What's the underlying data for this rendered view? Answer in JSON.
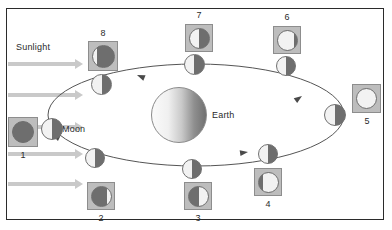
{
  "diagram": {
    "sunlight_label": "Sunlight",
    "earth_label": "Earth",
    "moon_label": "Moon",
    "orbit_direction": "counterclockwise",
    "colors": {
      "lit": "#f2f2f2",
      "dark": "#6e6e6e",
      "box_fill": "#bdbdbd",
      "box_border": "#8d8d8d",
      "arrow": "#c9c9c9",
      "orbit_line": "#555555",
      "frame_border": "#2b2b2b",
      "text": "#2a2a2a"
    },
    "sunlight_arrows": [
      {
        "x": 8,
        "y": 62,
        "length": 68
      },
      {
        "x": 8,
        "y": 93,
        "length": 68
      },
      {
        "x": 8,
        "y": 125,
        "length": 68
      },
      {
        "x": 8,
        "y": 152,
        "length": 68
      },
      {
        "x": 8,
        "y": 182,
        "length": 68
      }
    ],
    "earth": {
      "x": 151,
      "y": 87,
      "size": 56
    },
    "orbit": {
      "cx": 196,
      "cy": 115,
      "rx": 148,
      "ry": 51
    },
    "orbit_moons": [
      {
        "id": 1,
        "x": 41,
        "y": 118,
        "size": 22
      },
      {
        "id": 2,
        "x": 85,
        "y": 148,
        "size": 20
      },
      {
        "id": 3,
        "x": 182,
        "y": 159,
        "size": 20
      },
      {
        "id": 4,
        "x": 258,
        "y": 144,
        "size": 20
      },
      {
        "id": 5,
        "x": 324,
        "y": 104,
        "size": 22
      },
      {
        "id": 6,
        "x": 276,
        "y": 56,
        "size": 20
      },
      {
        "id": 7,
        "x": 184,
        "y": 54,
        "size": 21
      },
      {
        "id": 8,
        "x": 91,
        "y": 74,
        "size": 21
      }
    ],
    "phase_views": [
      {
        "number": "1",
        "phase_name": "new-moon",
        "lit_fraction": 0.0,
        "lit_side": "none",
        "box": {
          "x": 8,
          "y": 117,
          "size": 30
        },
        "disc": 22,
        "label_pos": {
          "x": 13,
          "y": 150
        }
      },
      {
        "number": "2",
        "phase_name": "waxing-crescent",
        "lit_fraction": 0.2,
        "lit_side": "right",
        "box": {
          "x": 87,
          "y": 182,
          "size": 28
        },
        "disc": 21,
        "label_pos": {
          "x": 91,
          "y": 213
        }
      },
      {
        "number": "3",
        "phase_name": "first-quarter",
        "lit_fraction": 0.5,
        "lit_side": "right",
        "box": {
          "x": 184,
          "y": 182,
          "size": 28
        },
        "disc": 21,
        "label_pos": {
          "x": 188,
          "y": 213
        }
      },
      {
        "number": "4",
        "phase_name": "waxing-gibbous",
        "lit_fraction": 0.78,
        "lit_side": "right",
        "box": {
          "x": 254,
          "y": 168,
          "size": 28
        },
        "disc": 21,
        "label_pos": {
          "x": 258,
          "y": 199
        }
      },
      {
        "number": "5",
        "phase_name": "full-moon",
        "lit_fraction": 1.0,
        "lit_side": "full",
        "box": {
          "x": 352,
          "y": 84,
          "size": 29
        },
        "disc": 21,
        "label_pos": {
          "x": 357,
          "y": 116
        }
      },
      {
        "number": "6",
        "phase_name": "waning-gibbous",
        "lit_fraction": 0.85,
        "lit_side": "left",
        "box": {
          "x": 273,
          "y": 26,
          "size": 28
        },
        "disc": 21,
        "label_pos": {
          "x": 277,
          "y": 12
        }
      },
      {
        "number": "7",
        "phase_name": "last-quarter",
        "lit_fraction": 0.5,
        "lit_side": "left",
        "box": {
          "x": 185,
          "y": 24,
          "size": 28
        },
        "disc": 21,
        "label_pos": {
          "x": 189,
          "y": 10
        }
      },
      {
        "number": "8",
        "phase_name": "waning-crescent",
        "lit_fraction": 0.18,
        "lit_side": "left",
        "box": {
          "x": 88,
          "y": 41,
          "size": 30
        },
        "disc": 23,
        "label_pos": {
          "x": 93,
          "y": 28
        }
      }
    ],
    "text_labels": {
      "sunlight": {
        "x": 16,
        "y": 42
      },
      "earth": {
        "x": 212,
        "y": 110
      },
      "moon": {
        "x": 62,
        "y": 124
      }
    }
  }
}
